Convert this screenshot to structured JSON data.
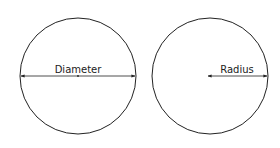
{
  "diagram": {
    "stroke_color": "#222222",
    "left": {
      "label": "Diameter",
      "cx": 78,
      "cy": 76,
      "r": 58
    },
    "right": {
      "label": "Radius",
      "cx": 210,
      "cy": 76,
      "r": 58
    }
  }
}
